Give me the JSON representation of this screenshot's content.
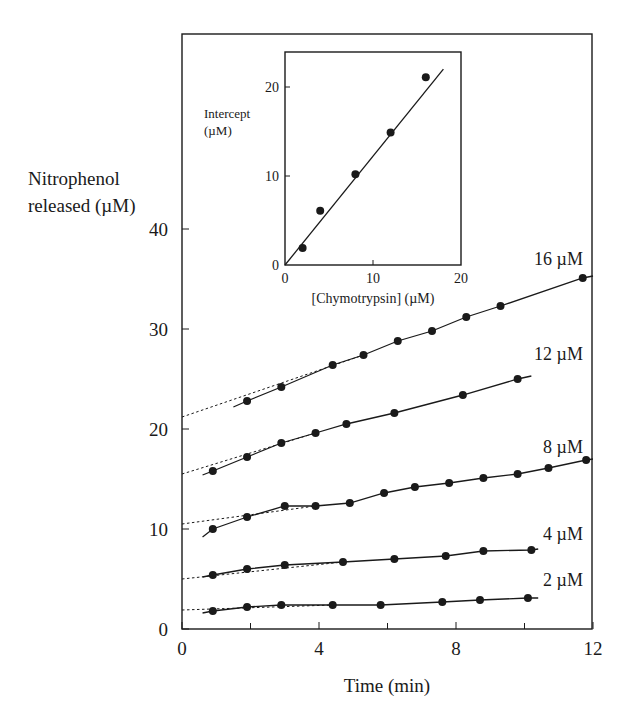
{
  "chart_data": [
    {
      "type": "line",
      "panel": "main",
      "title": "",
      "xlabel": "Time (min)",
      "ylabel": "Nitrophenol released (µM)",
      "xlim": [
        0,
        12
      ],
      "ylim": [
        0,
        45
      ],
      "xticks": [
        0,
        4,
        8,
        12
      ],
      "yticks": [
        0,
        10,
        20,
        30,
        40
      ],
      "minor_xticks": [
        2,
        6,
        10
      ],
      "grid": false,
      "legend": "inline labels at right end of each series",
      "series": [
        {
          "name": "16 µM",
          "label": "16 µM",
          "intercept": 21.2,
          "x": [
            1.9,
            2.9,
            4.4,
            5.3,
            6.3,
            7.3,
            8.3,
            9.3,
            11.7
          ],
          "y": [
            22.8,
            24.2,
            26.4,
            27.4,
            28.8,
            29.8,
            31.2,
            32.3,
            35.1
          ],
          "curve_start": [
            1.5,
            22.2
          ],
          "curve_end": [
            12.0,
            35.3
          ]
        },
        {
          "name": "12 µM",
          "label": "12 µM",
          "intercept": 15.5,
          "x": [
            0.9,
            1.9,
            2.9,
            3.9,
            4.8,
            6.2,
            8.2,
            9.8
          ],
          "y": [
            15.8,
            17.2,
            18.6,
            19.6,
            20.5,
            21.6,
            23.4,
            25.0
          ],
          "curve_start": [
            0.6,
            15.4
          ],
          "curve_end": [
            10.2,
            25.3
          ]
        },
        {
          "name": "8 µM",
          "label": "8 µM",
          "intercept": 10.5,
          "x": [
            0.9,
            1.9,
            3.0,
            3.9,
            4.9,
            5.9,
            6.8,
            7.8,
            8.8,
            9.8,
            10.7,
            11.8
          ],
          "y": [
            10.0,
            11.2,
            12.3,
            12.3,
            12.6,
            13.6,
            14.2,
            14.6,
            15.1,
            15.5,
            16.1,
            16.9
          ],
          "curve_start": [
            0.6,
            9.2
          ],
          "curve_end": [
            12.0,
            17.0
          ]
        },
        {
          "name": "4 µM",
          "label": "4 µM",
          "intercept": 5.0,
          "x": [
            0.9,
            1.9,
            3.0,
            4.7,
            6.2,
            7.7,
            8.8,
            10.2
          ],
          "y": [
            5.4,
            6.0,
            6.4,
            6.7,
            7.0,
            7.3,
            7.8,
            7.9
          ],
          "curve_start": [
            0.6,
            5.2
          ],
          "curve_end": [
            10.4,
            8.0
          ]
        },
        {
          "name": "2 µM",
          "label": "2 µM",
          "intercept": 1.9,
          "x": [
            0.9,
            1.9,
            2.9,
            4.4,
            5.8,
            7.6,
            8.7,
            10.1
          ],
          "y": [
            1.8,
            2.2,
            2.4,
            2.4,
            2.4,
            2.7,
            2.9,
            3.1
          ],
          "curve_start": [
            0.6,
            1.6
          ],
          "curve_end": [
            10.4,
            3.1
          ]
        }
      ]
    },
    {
      "type": "scatter",
      "panel": "inset",
      "title": "",
      "xlabel": "[Chymotrypsin] (µM)",
      "ylabel": "Intercept (µM)",
      "ylabel_lines": [
        "Intercept",
        "(µM)"
      ],
      "xlim": [
        0,
        20
      ],
      "ylim": [
        0,
        24
      ],
      "xticks": [
        0,
        10,
        20
      ],
      "yticks": [
        0,
        10,
        20
      ],
      "grid": false,
      "x": [
        2,
        4,
        8,
        12,
        16
      ],
      "y": [
        1.9,
        6.1,
        10.2,
        14.9,
        21.1
      ],
      "fit_line": {
        "x": [
          0,
          18
        ],
        "y": [
          0,
          22
        ]
      }
    }
  ],
  "labels": {
    "main_ylabel_line1": "Nitrophenol",
    "main_ylabel_line2": "released (µM)",
    "main_xlabel": "Time (min)",
    "inset_ylabel_line1": "Intercept",
    "inset_ylabel_line2": "(µM)",
    "inset_xlabel": "[Chymotrypsin] (µM)"
  },
  "colors": {
    "ink": "#1a1a1a",
    "background": "#ffffff"
  }
}
